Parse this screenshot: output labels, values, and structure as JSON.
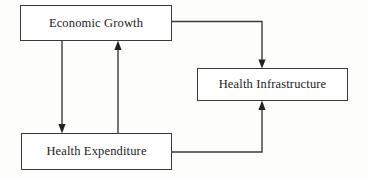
{
  "diagram": {
    "type": "flow-diagram",
    "canvas": {
      "width": 367,
      "height": 178,
      "background": "#fdfdfc"
    },
    "stroke_color": "#3a3a3a",
    "text_color": "#1b1b1b",
    "box_fill": "#ffffff",
    "nodes": [
      {
        "id": "economic-growth",
        "label": "Economic Growth",
        "x": 20,
        "y": 5,
        "width": 152,
        "height": 36
      },
      {
        "id": "health-infrastructure",
        "label": "Health Infrastructure",
        "x": 197,
        "y": 68,
        "width": 151,
        "height": 33
      },
      {
        "id": "health-expenditure",
        "label": "Health Expenditure",
        "x": 21,
        "y": 133,
        "width": 151,
        "height": 37
      }
    ],
    "edges": [
      {
        "id": "economic-growth-to-health-infrastructure",
        "from": "economic-growth",
        "to": "health-infrastructure",
        "direction": "down",
        "arrowhead": true
      },
      {
        "id": "health-expenditure-to-health-infrastructure",
        "from": "health-expenditure",
        "to": "health-infrastructure",
        "direction": "up",
        "arrowhead": true
      },
      {
        "id": "economic-growth-to-health-expenditure",
        "from": "economic-growth",
        "to": "health-expenditure",
        "direction": "down",
        "arrowhead": true
      },
      {
        "id": "health-expenditure-to-economic-growth",
        "from": "health-expenditure",
        "to": "economic-growth",
        "direction": "up",
        "arrowhead": true
      }
    ]
  }
}
